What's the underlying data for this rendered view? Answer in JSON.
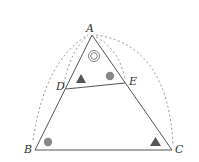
{
  "diagram": {
    "points": {
      "A": {
        "label": "A",
        "x": 92,
        "y": 35
      },
      "B": {
        "label": "B",
        "x": 35,
        "y": 150
      },
      "C": {
        "label": "C",
        "x": 172,
        "y": 150
      },
      "D": {
        "label": "D",
        "x": 66,
        "y": 89
      },
      "E": {
        "label": "E",
        "x": 125,
        "y": 83
      }
    },
    "segments": [
      "AB",
      "BC",
      "CA",
      "DE"
    ],
    "dashed_arcs": [
      "B to A (outer)",
      "D to A (inner)",
      "A to C (outer)",
      "A to E (inner)"
    ],
    "angle_marks": [
      {
        "at": "A",
        "symbol": "double-circle"
      },
      {
        "at": "D",
        "symbol": "filled-triangle"
      },
      {
        "at": "E",
        "symbol": "filled-circle"
      },
      {
        "at": "B",
        "symbol": "filled-circle"
      },
      {
        "at": "C",
        "symbol": "filled-triangle"
      }
    ],
    "colors": {
      "line": "#555555",
      "mark": "#777777",
      "dash": "#888888"
    }
  }
}
